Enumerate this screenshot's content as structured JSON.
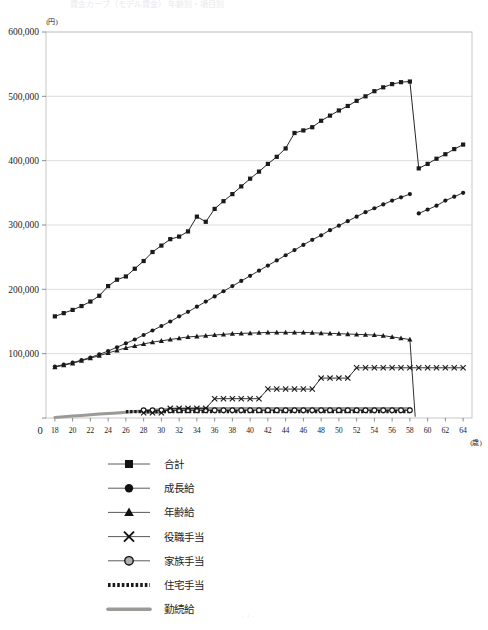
{
  "figure": {
    "title_ghost": "賃金カーブ（モデル賃金） 年齢別・項目別",
    "footer_ghost": "- 1 -",
    "yaxis_unit": "(円)",
    "xaxis_unit": "(歳)"
  },
  "chart_data": {
    "type": "line",
    "title": "",
    "subtitle": "",
    "xlabel": "(歳)",
    "ylabel": "(円)",
    "xlim": [
      17,
      65
    ],
    "ylim": [
      0,
      600000
    ],
    "yticks": [
      0,
      100000,
      200000,
      300000,
      400000,
      500000,
      600000
    ],
    "ytick_labels": [
      "0",
      "100,000",
      "200,000",
      "300,000",
      "400,000",
      "500,000",
      "600,000"
    ],
    "xticks": [
      18,
      20,
      22,
      24,
      26,
      28,
      30,
      32,
      34,
      36,
      38,
      40,
      42,
      44,
      46,
      48,
      50,
      52,
      54,
      56,
      58,
      60,
      62,
      64
    ],
    "xtick_labels": [
      "18",
      "20",
      "22",
      "24",
      "26",
      "28",
      "30",
      "32",
      "34",
      "36",
      "38",
      "40",
      "42",
      "44",
      "46",
      "48",
      "50",
      "52",
      "54",
      "56",
      "58",
      "60",
      "62",
      "64"
    ],
    "origin_label": "0",
    "grid": "horizontal",
    "legend_position": "below",
    "x": [
      18,
      19,
      20,
      21,
      22,
      23,
      24,
      25,
      26,
      27,
      28,
      29,
      30,
      31,
      32,
      33,
      34,
      35,
      36,
      37,
      38,
      39,
      40,
      41,
      42,
      43,
      44,
      45,
      46,
      47,
      48,
      49,
      50,
      51,
      52,
      53,
      54,
      55,
      56,
      57,
      58,
      59,
      60,
      61,
      62,
      63,
      64
    ],
    "series": [
      {
        "name": "合計",
        "marker": "square",
        "color": "#1a1a1a",
        "values": [
          158000,
          163000,
          168000,
          174000,
          181000,
          190000,
          205000,
          215000,
          220000,
          232000,
          244000,
          258000,
          268000,
          278000,
          282000,
          290000,
          313000,
          305000,
          325000,
          337000,
          348000,
          360000,
          372000,
          383000,
          395000,
          406000,
          419000,
          443000,
          447000,
          452000,
          462000,
          470000,
          478000,
          485000,
          493000,
          500000,
          508000,
          514000,
          519000,
          522000,
          523000,
          388000,
          395000,
          403000,
          410000,
          418000,
          425000
        ]
      },
      {
        "name": "成長給",
        "marker": "circle",
        "color": "#1a1a1a",
        "values": [
          80000,
          83000,
          86000,
          90000,
          94000,
          99000,
          104000,
          110000,
          116000,
          122000,
          129000,
          136000,
          143000,
          150000,
          158000,
          165000,
          173000,
          181000,
          189000,
          197000,
          205000,
          213000,
          221000,
          229000,
          237000,
          245000,
          253000,
          261000,
          269000,
          277000,
          284000,
          292000,
          299000,
          306000,
          313000,
          320000,
          326000,
          332000,
          338000,
          343000,
          348000,
          318000,
          324000,
          330000,
          338000,
          344000,
          350000
        ]
      },
      {
        "name": "年齢給",
        "marker": "triangle",
        "color": "#1a1a1a",
        "values": [
          79000,
          82000,
          85000,
          89000,
          93000,
          97000,
          101000,
          105000,
          109000,
          112000,
          115000,
          118000,
          120000,
          122000,
          124000,
          126000,
          127000,
          128000,
          129000,
          130000,
          131000,
          131500,
          132000,
          132500,
          133000,
          133000,
          133000,
          133000,
          133000,
          132500,
          132000,
          131500,
          131000,
          130500,
          130000,
          129500,
          129000,
          128000,
          126000,
          124000,
          122000,
          0,
          0,
          0,
          0,
          0,
          0
        ]
      },
      {
        "name": "役職手当",
        "marker": "cross",
        "color": "#1a1a1a",
        "values": [
          0,
          0,
          0,
          0,
          0,
          0,
          0,
          0,
          0,
          0,
          0,
          0,
          0,
          0,
          0,
          0,
          0,
          0,
          0,
          0,
          0,
          0,
          0,
          0,
          0,
          0,
          0,
          0,
          0,
          0,
          0,
          0,
          0,
          0,
          0,
          0,
          0,
          0,
          0,
          0,
          0,
          0,
          0,
          0,
          0,
          0,
          0
        ]
      },
      {
        "name": "家族手当",
        "marker": "circle-open",
        "color": "#1a1a1a",
        "values": [
          0,
          0,
          0,
          0,
          0,
          0,
          0,
          0,
          0,
          0,
          12000,
          12000,
          12000,
          12000,
          12000,
          12000,
          12000,
          12000,
          12000,
          12000,
          12000,
          12000,
          12000,
          12000,
          12000,
          12000,
          12000,
          12000,
          12000,
          12000,
          12000,
          12000,
          12000,
          12000,
          12000,
          12000,
          12000,
          12000,
          12000,
          12000,
          12000,
          0,
          0,
          0,
          0,
          0,
          0
        ]
      },
      {
        "name": "住宅手当",
        "marker": "dotted",
        "color": "#1a1a1a",
        "values": [
          0,
          0,
          0,
          0,
          0,
          0,
          0,
          0,
          10000,
          10000,
          10000,
          10000,
          10000,
          10000,
          10000,
          10000,
          10000,
          10000,
          10000,
          10000,
          10000,
          10000,
          10000,
          10000,
          10000,
          10000,
          10000,
          10000,
          10000,
          10000,
          10000,
          10000,
          10000,
          10000,
          10000,
          10000,
          10000,
          10000,
          10000,
          10000,
          10000,
          0,
          0,
          0,
          0,
          0,
          0
        ]
      },
      {
        "name": "勤続給",
        "marker": "thick-line",
        "color": "#9a9a96",
        "values": [
          1000,
          2000,
          3000,
          4000,
          5000,
          6000,
          7000,
          8000,
          9000,
          10000,
          11000,
          12000,
          13000,
          13500,
          14000,
          14500,
          15000,
          15000,
          15000,
          15000,
          15000,
          15000,
          15000,
          15000,
          15000,
          15000,
          15000,
          15000,
          15000,
          15000,
          15000,
          15000,
          15000,
          15000,
          15000,
          15000,
          15000,
          15000,
          15000,
          15000,
          15000,
          0,
          0,
          0,
          0,
          0,
          0
        ]
      }
    ],
    "yakushoku_steps": {
      "name": "役職手当",
      "x": [
        28,
        29,
        30,
        31,
        32,
        33,
        34,
        35,
        36,
        37,
        38,
        39,
        40,
        41,
        42,
        43,
        44,
        45,
        46,
        47,
        48,
        49,
        50,
        51,
        52,
        53,
        54,
        55,
        56,
        57,
        58,
        59,
        60,
        61,
        62,
        63,
        64
      ],
      "values": [
        8000,
        8000,
        8000,
        15000,
        15000,
        15000,
        15000,
        15000,
        30000,
        30000,
        30000,
        30000,
        30000,
        30000,
        45000,
        45000,
        45000,
        45000,
        45000,
        45000,
        62000,
        62000,
        62000,
        62000,
        78000,
        78000,
        78000,
        78000,
        78000,
        78000,
        78000,
        78000,
        78000,
        78000,
        78000,
        78000,
        78000
      ]
    }
  },
  "legend": {
    "items": [
      {
        "label": "合計",
        "marker": "square"
      },
      {
        "label": "成長給",
        "marker": "circle"
      },
      {
        "label": "年齢給",
        "marker": "triangle"
      },
      {
        "label": "役職手当",
        "marker": "cross"
      },
      {
        "label": "家族手当",
        "marker": "circle-open"
      },
      {
        "label": "住宅手当",
        "marker": "dotted"
      },
      {
        "label": "勤続給",
        "marker": "thick-line"
      }
    ]
  }
}
